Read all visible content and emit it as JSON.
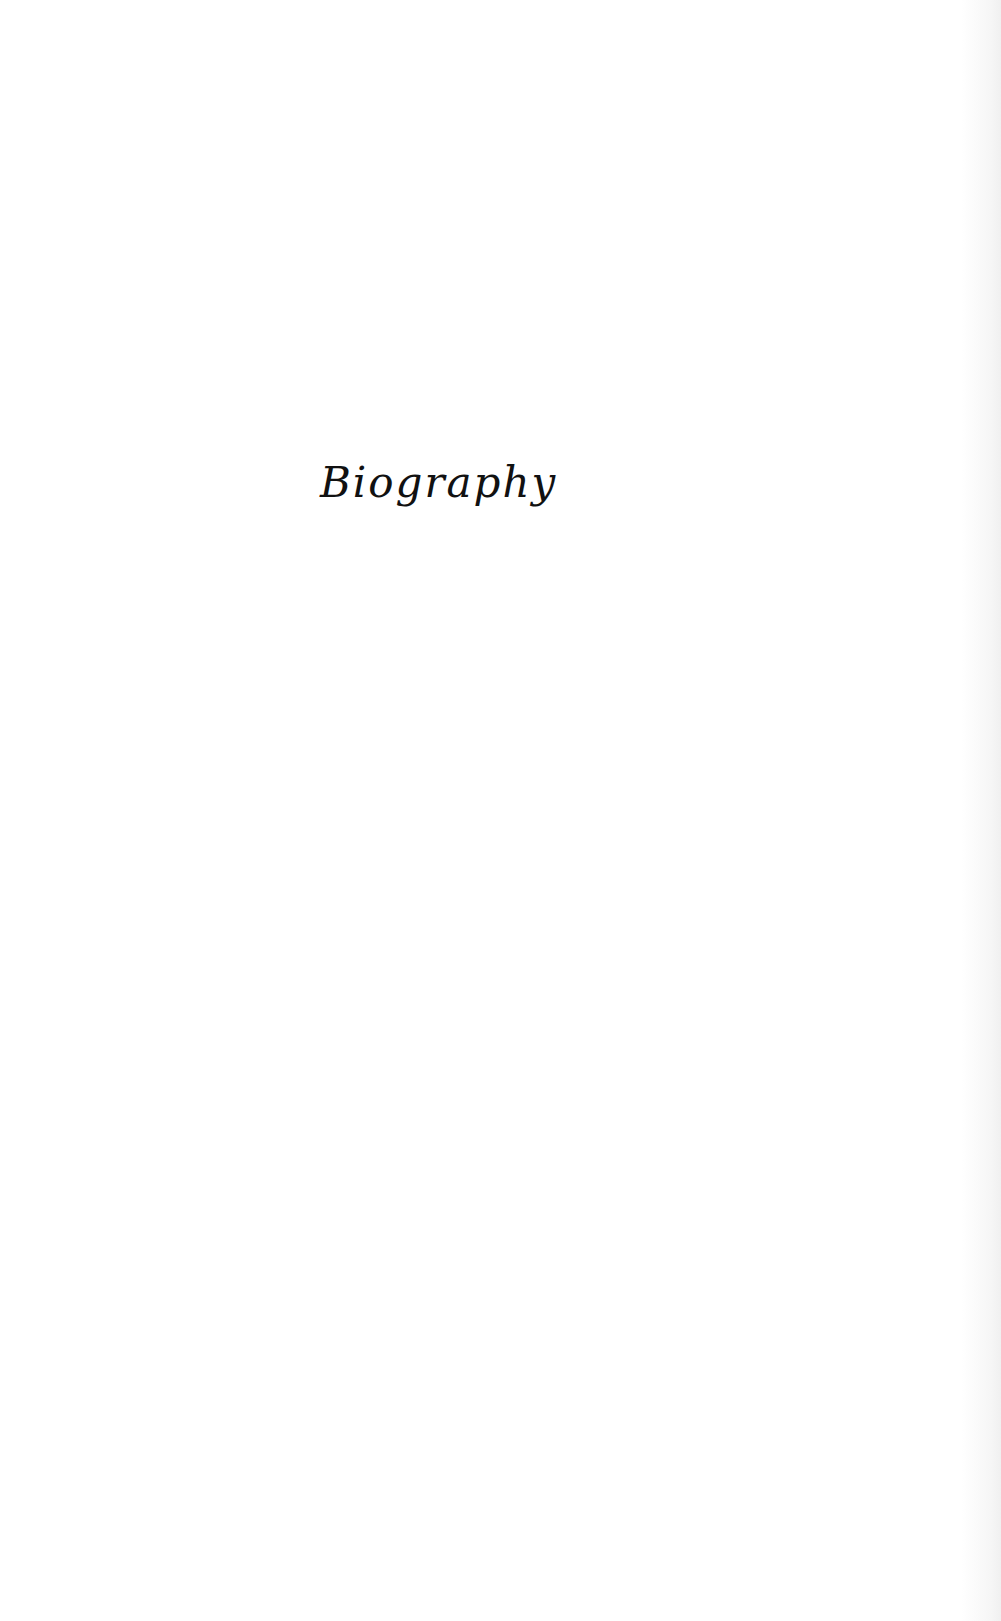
{
  "page": {
    "section_title": "Biography"
  }
}
